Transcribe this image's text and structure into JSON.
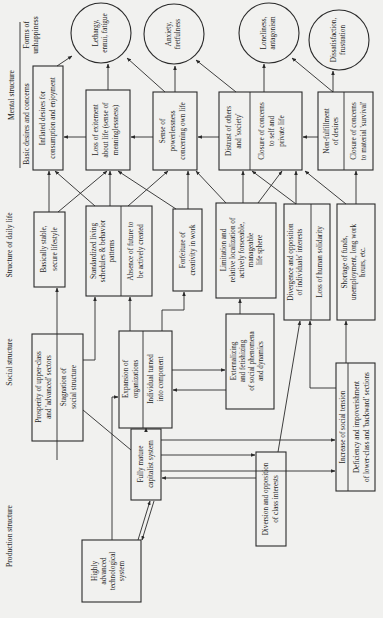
{
  "row_labels": {
    "mental_structure": "Mental structure",
    "forms_of_unhappiness_1": "Forms of",
    "forms_of_unhappiness_2": "unhappiness",
    "basic_desires": "Basic desires and concerns",
    "structure_daily_life": "Structure of daily life",
    "social_structure": "Social structure",
    "production_structure": "Production structure"
  },
  "unhappiness": [
    {
      "l1": "Lethargy,",
      "l2": "ennui, fatigue"
    },
    {
      "l1": "Anxiety,",
      "l2": "fretfulness"
    },
    {
      "l1": "Loneliness,",
      "l2": "antagonism"
    },
    {
      "l1": "Dissatisfaction,",
      "l2": "frustration"
    }
  ],
  "desires": {
    "inflated": {
      "l1": "Inflated desires for",
      "l2": "consumption and enjoyment"
    },
    "excitement": {
      "l1": "Loss of exitement",
      "l2": "about life (sense of",
      "l3": "meaninglessness)"
    },
    "powerless": {
      "l1": "Sense of",
      "l2": "powerlessness",
      "l3": "concerning own life"
    },
    "distrust": {
      "l1": "Distrust of others",
      "l2": "and 'society'"
    },
    "closure_private": {
      "l1": "Closure of concerns",
      "l2": "to self and",
      "l3": "private life"
    },
    "nonfulfillment": {
      "l1": "Non-fulfillment",
      "l2": "of desires"
    },
    "closure_survival": {
      "l1": "Closure of concerns",
      "l2": "to material 'survival'"
    }
  },
  "daily_life": {
    "stable": {
      "l1": "Basically stable,",
      "l2": "secure lifestyle"
    },
    "standardized": {
      "l1": "Standardized living",
      "l2": "schedules & behavior",
      "l3": "patterns"
    },
    "absence": {
      "l1": "Absence of future to",
      "l2": "be actively created"
    },
    "forfeiture": {
      "l1": "Forfeiture of",
      "l2": "creativity in work"
    },
    "limitation": {
      "l1": "Limitation and",
      "l2": "relative localization of",
      "l3": "actively forseeable,",
      "l4": "manageable",
      "l5": "life sphere"
    },
    "divergence": {
      "l1": "Divergence and opposition",
      "l2": "of individuals' interests"
    },
    "solidarity": {
      "l1": "Loss of human solidarity"
    },
    "shortage": {
      "l1": "Shortage of funds,",
      "l2": "unemployment, long work",
      "l3": "hours, etc."
    }
  },
  "social": {
    "prosperity": {
      "l1": "Prosperity of upper-class",
      "l2": "and 'advanced' sectors"
    },
    "stagnation": {
      "l1": "Stagnation of",
      "l2": "social structure"
    },
    "expansion": {
      "l1": "Expansion of",
      "l2": "organizations"
    },
    "individual": {
      "l1": "Individual turned",
      "l2": "into component"
    },
    "externalizing": {
      "l1": "Externalizing",
      "l2": "and fetishizing",
      "l3": "of social phenomena",
      "l4": "and dynamics"
    },
    "tension": {
      "l1": "Increase of social tension"
    },
    "deficiency": {
      "l1": "Deficiency and impoverishment",
      "l2": "of lower-class and 'backward' sections"
    }
  },
  "production": {
    "capitalist": {
      "l1": "Fully mature",
      "l2": "capitalist system"
    },
    "diversion": {
      "l1": "Diversion and opposition",
      "l2": "of class interests"
    },
    "technological": {
      "l1": "Highly",
      "l2": "advanced",
      "l3": "technological",
      "l4": "system"
    }
  }
}
